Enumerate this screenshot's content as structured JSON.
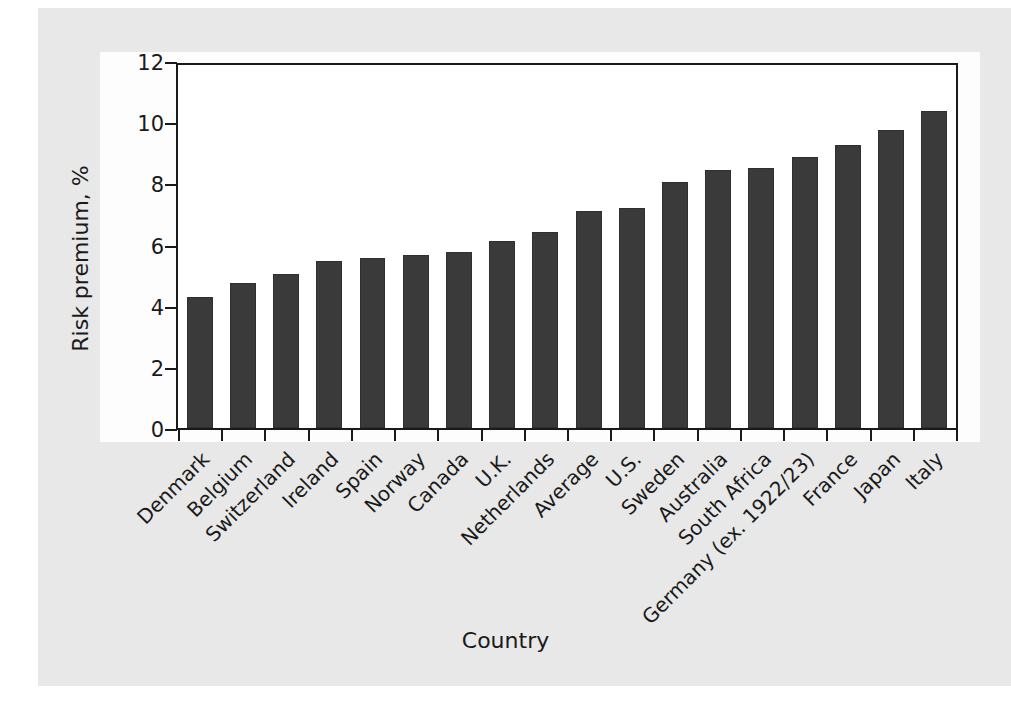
{
  "chart_data": {
    "type": "bar",
    "title": "",
    "xlabel": "Country",
    "ylabel": "Risk premium, %",
    "ylim": [
      0,
      12
    ],
    "yticks": [
      0,
      2,
      4,
      6,
      8,
      10,
      12
    ],
    "grid": false,
    "legend": null,
    "categories": [
      "Denmark",
      "Belgium",
      "Switzerland",
      "Ireland",
      "Spain",
      "Norway",
      "Canada",
      "U.K.",
      "Netherlands",
      "Average",
      "U.S.",
      "Sweden",
      "Australia",
      "South Africa",
      "Germany (ex. 1922/23)",
      "France",
      "Japan",
      "Italy"
    ],
    "values": [
      4.3,
      4.75,
      5.05,
      5.45,
      5.55,
      5.65,
      5.75,
      6.1,
      6.4,
      7.1,
      7.2,
      8.05,
      8.45,
      8.5,
      8.85,
      9.25,
      9.75,
      10.35
    ],
    "bar_color": "#3a3a3a",
    "axis_color": "#1a1a1a",
    "plot_background": "#ffffff",
    "page_background": "#e8e8e8"
  }
}
